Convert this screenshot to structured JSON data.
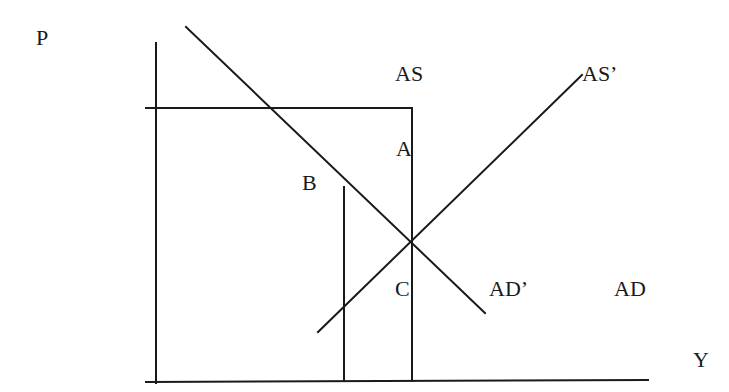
{
  "diagram": {
    "type": "AS-AD economics diagram",
    "axes": {
      "y_label": "P",
      "x_label": "Y"
    },
    "curve_labels": {
      "as": "AS",
      "as_prime": "AS’",
      "ad": "AD",
      "ad_prime": "AD’"
    },
    "point_labels": {
      "a": "A",
      "b": "B",
      "c": "C"
    },
    "line_color": "#1a1a1a"
  }
}
